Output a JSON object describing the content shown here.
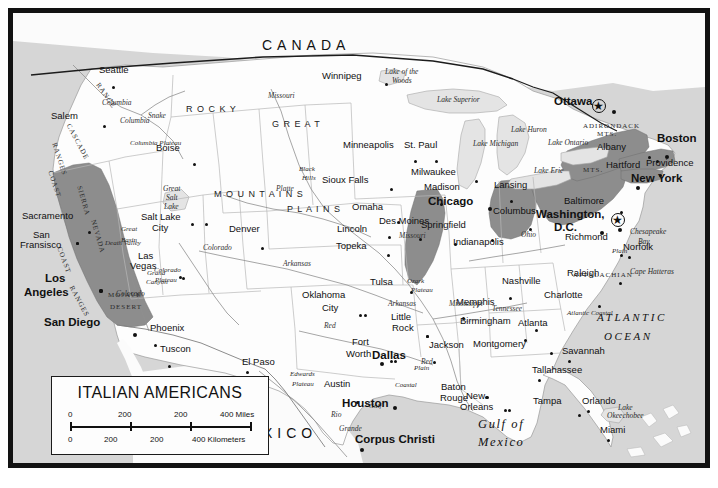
{
  "map": {
    "title": "ITALIAN AMERICANS",
    "theme_color": "#8d8d8d",
    "land_color": "#fdfdfd",
    "water_color": "#d6d6d6",
    "frame_color": "#121212",
    "legend": {
      "title": "ITALIAN AMERICANS",
      "scale_miles": {
        "ticks": [
          "0",
          "200",
          "200",
          "400 Miles"
        ]
      },
      "scale_kilometers": {
        "ticks": [
          "0",
          "200",
          "200",
          "400 Kilometers"
        ]
      }
    },
    "countries": [
      {
        "name": "CANADA",
        "x": 262,
        "y": 38
      },
      {
        "name": "MEXICO",
        "x": 232,
        "y": 426
      }
    ],
    "oceans": [
      {
        "name": "ATLANTIC",
        "x": 597,
        "y": 312
      },
      {
        "name": "OCEAN",
        "x": 604,
        "y": 331
      },
      {
        "name": "Gulf of",
        "x": 478,
        "y": 418
      },
      {
        "name": "Mexico",
        "x": 478,
        "y": 436
      }
    ],
    "water_features": [
      {
        "name": "Lake of the",
        "x": 385,
        "y": 68
      },
      {
        "name": "Woods",
        "x": 392,
        "y": 77
      },
      {
        "name": "Lake Superior",
        "x": 437,
        "y": 96
      },
      {
        "name": "Lake Michigan",
        "x": 473,
        "y": 140
      },
      {
        "name": "Lake Huron",
        "x": 511,
        "y": 126
      },
      {
        "name": "Lake Erie",
        "x": 534,
        "y": 167
      },
      {
        "name": "Lake Ontario",
        "x": 548,
        "y": 139
      },
      {
        "name": "Great",
        "x": 163,
        "y": 185
      },
      {
        "name": "Salt",
        "x": 166,
        "y": 194
      },
      {
        "name": "Lake",
        "x": 164,
        "y": 203
      },
      {
        "name": "Lake",
        "x": 618,
        "y": 404
      },
      {
        "name": "Okeechobee",
        "x": 607,
        "y": 412
      },
      {
        "name": "Chesapeake",
        "x": 630,
        "y": 228
      },
      {
        "name": "Bay",
        "x": 638,
        "y": 238
      },
      {
        "name": "Cape Hatteras",
        "x": 630,
        "y": 268
      }
    ],
    "rivers": [
      {
        "name": "Columbia",
        "x": 102,
        "y": 99
      },
      {
        "name": "Columbia",
        "x": 120,
        "y": 117
      },
      {
        "name": "Snake",
        "x": 148,
        "y": 112
      },
      {
        "name": "Missouri",
        "x": 268,
        "y": 92
      },
      {
        "name": "Platte",
        "x": 276,
        "y": 185
      },
      {
        "name": "Missouri",
        "x": 399,
        "y": 232
      },
      {
        "name": "Arkansas",
        "x": 283,
        "y": 260
      },
      {
        "name": "Arkansas",
        "x": 388,
        "y": 300
      },
      {
        "name": "Colorado",
        "x": 203,
        "y": 244
      },
      {
        "name": "Colorado",
        "x": 116,
        "y": 290
      },
      {
        "name": "Mississippi",
        "x": 449,
        "y": 300
      },
      {
        "name": "Ohio",
        "x": 521,
        "y": 231
      },
      {
        "name": "Tennessee",
        "x": 492,
        "y": 305
      },
      {
        "name": "Red",
        "x": 324,
        "y": 322
      },
      {
        "name": "Red",
        "x": 421,
        "y": 358
      },
      {
        "name": "Rio",
        "x": 331,
        "y": 411
      },
      {
        "name": "Grande",
        "x": 339,
        "y": 425
      }
    ],
    "physiographic": [
      {
        "name": "CASCADE",
        "x": 71,
        "y": 123,
        "rot": 62
      },
      {
        "name": "RANGE",
        "x": 100,
        "y": 82,
        "rot": 55
      },
      {
        "name": "COAST",
        "x": 53,
        "y": 170,
        "rot": 72
      },
      {
        "name": "RANGES",
        "x": 57,
        "y": 142,
        "rot": 72
      },
      {
        "name": "COAST",
        "x": 62,
        "y": 246,
        "rot": 70
      },
      {
        "name": "RANGES",
        "x": 74,
        "y": 285,
        "rot": 62
      },
      {
        "name": "SIERRA",
        "x": 82,
        "y": 185,
        "rot": 74
      },
      {
        "name": "NEVADA",
        "x": 96,
        "y": 219,
        "rot": 74
      },
      {
        "name": "Columbia Plateau",
        "x": 130,
        "y": 140
      },
      {
        "name": "R O C K Y",
        "x": 186,
        "y": 105
      },
      {
        "name": "M O U N T A I N S",
        "x": 214,
        "y": 190
      },
      {
        "name": "G R E A T",
        "x": 272,
        "y": 120
      },
      {
        "name": "P L A I N S",
        "x": 287,
        "y": 205
      },
      {
        "name": "Black",
        "x": 299,
        "y": 166
      },
      {
        "name": "Hills",
        "x": 302,
        "y": 175
      },
      {
        "name": "Great",
        "x": 121,
        "y": 226
      },
      {
        "name": "Basin",
        "x": 121,
        "y": 237
      },
      {
        "name": "Death Valley",
        "x": 105,
        "y": 240
      },
      {
        "name": "MOJAVE",
        "x": 108,
        "y": 292
      },
      {
        "name": "DESERT",
        "x": 110,
        "y": 304
      },
      {
        "name": "Grand",
        "x": 147,
        "y": 270
      },
      {
        "name": "Canyon",
        "x": 146,
        "y": 279
      },
      {
        "name": "Colorado",
        "x": 154,
        "y": 267
      },
      {
        "name": "Plateau",
        "x": 155,
        "y": 277
      },
      {
        "name": "Ozark",
        "x": 407,
        "y": 278
      },
      {
        "name": "Plateau",
        "x": 411,
        "y": 287
      },
      {
        "name": "APPALACHIAN",
        "x": 573,
        "y": 272
      },
      {
        "name": "MTS.",
        "x": 583,
        "y": 167
      },
      {
        "name": "ADIRONDACK",
        "x": 583,
        "y": 123
      },
      {
        "name": "MTS.",
        "x": 597,
        "y": 131
      },
      {
        "name": "Coastal",
        "x": 395,
        "y": 382
      },
      {
        "name": "Plain",
        "x": 414,
        "y": 365
      },
      {
        "name": "Atlantic Coastal",
        "x": 567,
        "y": 310
      },
      {
        "name": "Plain",
        "x": 612,
        "y": 248
      },
      {
        "name": "Gulf",
        "x": 369,
        "y": 403
      },
      {
        "name": "Edwards",
        "x": 290,
        "y": 371
      },
      {
        "name": "Plateau",
        "x": 292,
        "y": 381
      }
    ],
    "cities": [
      {
        "name": "Seattle",
        "x": 99,
        "y": 65,
        "dx": 0,
        "dy": 10,
        "major": false
      },
      {
        "name": "Salem",
        "x": 51,
        "y": 111,
        "dx": 39,
        "dy": 3,
        "major": false
      },
      {
        "name": "Boise",
        "x": 156,
        "y": 143,
        "dx": 24,
        "dy": 9,
        "major": false
      },
      {
        "name": "Sacramento",
        "x": 22,
        "y": 211,
        "dx": 53,
        "dy": 9,
        "major": false
      },
      {
        "name": "San",
        "x": 33,
        "y": 230,
        "dx": 30,
        "dy": 1,
        "major": false
      },
      {
        "name": "Fransisco",
        "x": 20,
        "y": 240,
        "dx": 43,
        "dy": -9,
        "major": false
      },
      {
        "name": "Los",
        "x": 45,
        "y": 273,
        "dx": 41,
        "dy": 5,
        "major": true
      },
      {
        "name": "Angeles",
        "x": 24,
        "y": 287,
        "dx": 62,
        "dy": -9,
        "major": true
      },
      {
        "name": "San Diego",
        "x": 44,
        "y": 317,
        "dx": 76,
        "dy": 5,
        "major": true
      },
      {
        "name": "Las",
        "x": 138,
        "y": 251,
        "dx": 28,
        "dy": 14,
        "major": false
      },
      {
        "name": "Vegas",
        "x": 130,
        "y": 261,
        "dx": 39,
        "dy": 5,
        "major": false
      },
      {
        "name": "Salt Lake",
        "x": 141,
        "y": 212,
        "dx": 51,
        "dy": 0,
        "major": false
      },
      {
        "name": "City",
        "x": 152,
        "y": 223,
        "dx": 26,
        "dy": -11,
        "major": false
      },
      {
        "name": "Phoenix",
        "x": 150,
        "y": 323,
        "dx": -9,
        "dy": 10,
        "major": false
      },
      {
        "name": "Tuscon",
        "x": 160,
        "y": 344,
        "dx": -5,
        "dy": 10,
        "major": false
      },
      {
        "name": "El Paso",
        "x": 242,
        "y": 357,
        "dx": -9,
        "dy": 3,
        "major": false
      },
      {
        "name": "Denver",
        "x": 229,
        "y": 224,
        "dx": 19,
        "dy": 12,
        "major": false
      },
      {
        "name": "Winnipeg",
        "x": 322,
        "y": 71,
        "dx": 50,
        "dy": 1,
        "major": false
      },
      {
        "name": "Minneapolis",
        "x": 343,
        "y": 140,
        "dx": 58,
        "dy": 9,
        "major": false
      },
      {
        "name": "St. Paul",
        "x": 404,
        "y": 140,
        "dx": 18,
        "dy": 9,
        "major": false
      },
      {
        "name": "Sioux Falls",
        "x": 322,
        "y": 175,
        "dx": 55,
        "dy": 2,
        "major": false
      },
      {
        "name": "Omaha",
        "x": 352,
        "y": 202,
        "dx": 32,
        "dy": 8,
        "major": false
      },
      {
        "name": "Des Moines",
        "x": 379,
        "y": 216,
        "dx": 27,
        "dy": 11,
        "major": false
      },
      {
        "name": "Lincoln",
        "x": 337,
        "y": 224,
        "dx": 38,
        "dy": 1,
        "major": false
      },
      {
        "name": "Topeka",
        "x": 336,
        "y": 241,
        "dx": 38,
        "dy": 2,
        "major": false
      },
      {
        "name": "Milwaukee",
        "x": 411,
        "y": 167,
        "dx": 51,
        "dy": 2,
        "major": false
      },
      {
        "name": "Madison",
        "x": 424,
        "y": 182,
        "dx": 3,
        "dy": 10,
        "major": false
      },
      {
        "name": "Chicago",
        "x": 428,
        "y": 196,
        "dx": 47,
        "dy": 0,
        "major": true
      },
      {
        "name": "Lansing",
        "x": 494,
        "y": 180,
        "dx": 3,
        "dy": 9,
        "major": false
      },
      {
        "name": "Springfield",
        "x": 421,
        "y": 220,
        "dx": 20,
        "dy": 12,
        "major": false
      },
      {
        "name": "Indianapolis",
        "x": 453,
        "y": 237,
        "dx": 25,
        "dy": -9,
        "major": false
      },
      {
        "name": "Columbus",
        "x": 493,
        "y": 206,
        "dx": 23,
        "dy": 11,
        "major": false
      },
      {
        "name": "Cincinnati",
        "x": 0,
        "y": 0,
        "dx": 0,
        "dy": 0,
        "major": false
      },
      {
        "name": "Washington,",
        "x": 536,
        "y": 209,
        "dx": 69,
        "dy": 8,
        "major": true
      },
      {
        "name": "D.C.",
        "x": 554,
        "y": 222,
        "dx": 33,
        "dy": -2,
        "major": true
      },
      {
        "name": "Baltimore",
        "x": 564,
        "y": 196,
        "dx": 43,
        "dy": 4,
        "major": false
      },
      {
        "name": "Richmond",
        "x": 565,
        "y": 232,
        "dx": 42,
        "dy": 11,
        "major": false
      },
      {
        "name": "Norfolk",
        "x": 623,
        "y": 242,
        "dx": -8,
        "dy": 3,
        "major": false
      },
      {
        "name": "Raleigh",
        "x": 567,
        "y": 268,
        "dx": 39,
        "dy": 3,
        "major": false
      },
      {
        "name": "Charlotte",
        "x": 544,
        "y": 290,
        "dx": 41,
        "dy": 4,
        "major": false
      },
      {
        "name": "Nashville",
        "x": 502,
        "y": 276,
        "dx": -6,
        "dy": 10,
        "major": false
      },
      {
        "name": "Memphis",
        "x": 456,
        "y": 297,
        "dx": -7,
        "dy": 9,
        "major": false
      },
      {
        "name": "Birmingham",
        "x": 460,
        "y": 316,
        "dx": 62,
        "dy": 2,
        "major": false
      },
      {
        "name": "Atlanta",
        "x": 518,
        "y": 318,
        "dx": -7,
        "dy": 10,
        "major": false
      },
      {
        "name": "Montgomery",
        "x": 473,
        "y": 339,
        "dx": 64,
        "dy": 2,
        "major": false
      },
      {
        "name": "Savannah",
        "x": 562,
        "y": 346,
        "dx": -7,
        "dy": 3,
        "major": false
      },
      {
        "name": "Tallahassee",
        "x": 532,
        "y": 365,
        "dx": -7,
        "dy": 3,
        "major": false
      },
      {
        "name": "Jackson",
        "x": 429,
        "y": 340,
        "dx": -9,
        "dy": 10,
        "major": false
      },
      {
        "name": "Tulsa",
        "x": 370,
        "y": 277,
        "dx": 27,
        "dy": 3,
        "major": false
      },
      {
        "name": "Little",
        "x": 391,
        "y": 312,
        "dx": 22,
        "dy": 12,
        "major": false
      },
      {
        "name": "Rock",
        "x": 392,
        "y": 323,
        "dx": 21,
        "dy": 1,
        "major": false
      },
      {
        "name": "Oklahoma",
        "x": 302,
        "y": 290,
        "dx": 49,
        "dy": 13,
        "major": false
      },
      {
        "name": "City",
        "x": 322,
        "y": 303,
        "dx": 24,
        "dy": 0,
        "major": false
      },
      {
        "name": "Fort",
        "x": 352,
        "y": 337,
        "dx": 25,
        "dy": 12,
        "major": false
      },
      {
        "name": "Worth",
        "x": 346,
        "y": 349,
        "dx": 35,
        "dy": 0,
        "major": false
      },
      {
        "name": "Dallas",
        "x": 372,
        "y": 350,
        "dx": -5,
        "dy": 1,
        "major": true
      },
      {
        "name": "Austin",
        "x": 324,
        "y": 379,
        "dx": 19,
        "dy": 11,
        "major": false
      },
      {
        "name": "Houston",
        "x": 342,
        "y": 398,
        "dx": 38,
        "dy": -3,
        "major": true
      },
      {
        "name": "Corpus Christi",
        "x": 355,
        "y": 434,
        "dx": -8,
        "dy": 3,
        "major": true
      },
      {
        "name": "Baton",
        "x": 441,
        "y": 382,
        "dx": 31,
        "dy": 3,
        "major": false
      },
      {
        "name": "Rouge",
        "x": 440,
        "y": 393,
        "dx": 33,
        "dy": -8,
        "major": false
      },
      {
        "name": "New",
        "x": 466,
        "y": 391,
        "dx": 25,
        "dy": 7,
        "major": false
      },
      {
        "name": "Orleans",
        "x": 460,
        "y": 402,
        "dx": 35,
        "dy": -4,
        "major": false
      },
      {
        "name": "Tampa",
        "x": 533,
        "y": 396,
        "dx": 32,
        "dy": 7,
        "major": false
      },
      {
        "name": "Orlando",
        "x": 582,
        "y": 396,
        "dx": -8,
        "dy": 3,
        "major": false
      },
      {
        "name": "Miami",
        "x": 600,
        "y": 425,
        "dx": -6,
        "dy": 3,
        "major": false
      },
      {
        "name": "Ottawa",
        "x": 554,
        "y": 96,
        "dx": 45,
        "dy": 3,
        "major": true
      },
      {
        "name": "Albany",
        "x": 597,
        "y": 142,
        "dx": 38,
        "dy": 3,
        "major": false
      },
      {
        "name": "Boston",
        "x": 657,
        "y": 133,
        "dx": -5,
        "dy": 11,
        "major": true
      },
      {
        "name": "Providence",
        "x": 646,
        "y": 158,
        "dx": -3,
        "dy": -9,
        "major": false
      },
      {
        "name": "Hartford",
        "x": 606,
        "y": 160,
        "dx": 40,
        "dy": 3,
        "major": false
      },
      {
        "name": "New York",
        "x": 631,
        "y": 173,
        "dx": -8,
        "dy": 2,
        "major": true
      }
    ],
    "capitals": [
      {
        "name": "Ottawa",
        "x": 593,
        "y": 100
      },
      {
        "name": "Washington D.C.",
        "x": 612,
        "y": 214
      }
    ]
  }
}
